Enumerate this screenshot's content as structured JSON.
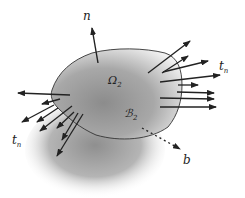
{
  "diagram": {
    "labels": {
      "normal": "n",
      "traction_right": "t",
      "traction_right_sub": "n",
      "traction_left": "t",
      "traction_left_sub": "n",
      "domain": "Ω",
      "domain_sub": "2",
      "boundary": "ℬ",
      "boundary_sub": "2",
      "body_force": "b"
    },
    "colors": {
      "body_fill_dark": "#8a8a8a",
      "body_fill_light": "#d8d8d8",
      "shadow": "#9a9a9a",
      "arrow": "#222222",
      "outline": "#333333"
    }
  }
}
